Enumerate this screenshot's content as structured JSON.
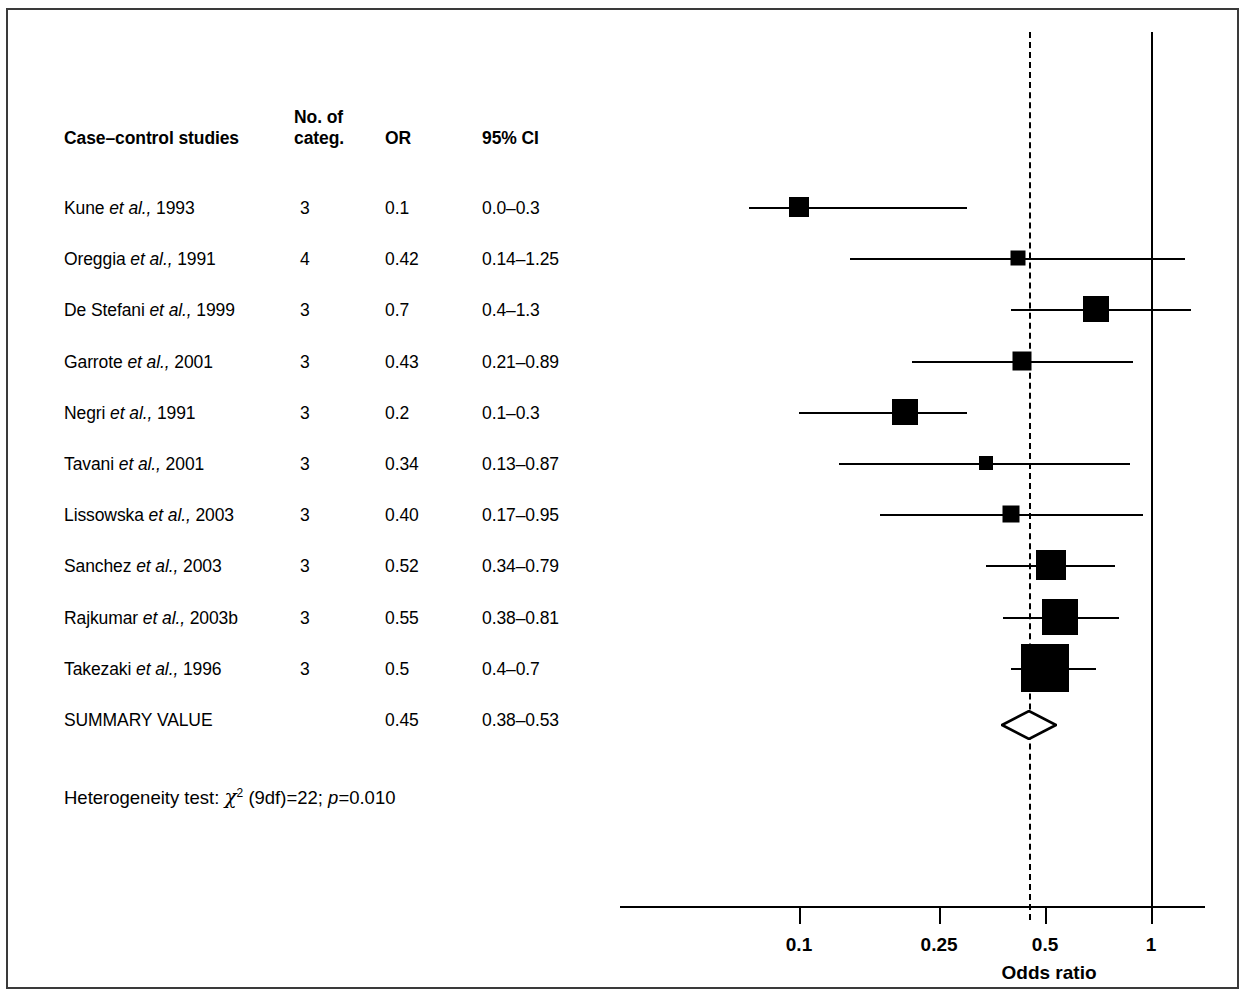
{
  "figure": {
    "caption_visible_fragment": "Figure 12. Case-control studies of",
    "axis_title": "Odds ratio"
  },
  "table": {
    "headers": {
      "study": "Case–control studies",
      "categ_line1": "No. of",
      "categ_line2": "categ.",
      "or": "OR",
      "ci": "95% CI"
    },
    "rows": [
      {
        "author": "Kune",
        "etal": "et al.,",
        "year": "1993",
        "label": "Kune et al., 1993",
        "categ": "3",
        "or": "0.1",
        "ci": "0.0–0.3"
      },
      {
        "author": "Oreggia",
        "etal": "et al.,",
        "year": "1991",
        "label": "Oreggia et al., 1991",
        "categ": "4",
        "or": "0.42",
        "ci": "0.14–1.25"
      },
      {
        "author": "De Stefani",
        "etal": "et al.,",
        "year": "1999",
        "label": "De Stefani et al., 1999",
        "categ": "3",
        "or": "0.7",
        "ci": "0.4–1.3"
      },
      {
        "author": "Garrote",
        "etal": "et al.,",
        "year": "2001",
        "label": "Garrote et al., 2001",
        "categ": "3",
        "or": "0.43",
        "ci": "0.21–0.89"
      },
      {
        "author": "Negri",
        "etal": "et al.,",
        "year": "1991",
        "label": "Negri et al., 1991",
        "categ": "3",
        "or": "0.2",
        "ci": "0.1–0.3"
      },
      {
        "author": "Tavani",
        "etal": "et al.,",
        "year": "2001",
        "label": "Tavani et al., 2001",
        "categ": "3",
        "or": "0.34",
        "ci": "0.13–0.87"
      },
      {
        "author": "Lissowska",
        "etal": "et al.,",
        "year": "2003",
        "label": "Lissowska et al., 2003",
        "categ": "3",
        "or": "0.40",
        "ci": "0.17–0.95"
      },
      {
        "author": "Sanchez",
        "etal": "et al.,",
        "year": "2003",
        "label": "Sanchez et al., 2003",
        "categ": "3",
        "or": "0.52",
        "ci": "0.34–0.79"
      },
      {
        "author": "Rajkumar",
        "etal": "et al.,",
        "year": "2003b",
        "label": "Rajkumar et al., 2003b",
        "categ": "3",
        "or": "0.55",
        "ci": "0.38–0.81"
      },
      {
        "author": "Takezaki",
        "etal": "et al.,",
        "year": "1996",
        "label": "Takezaki et al., 1996",
        "categ": "3",
        "or": "0.5",
        "ci": "0.4–0.7"
      },
      {
        "author": "SUMMARY VALUE",
        "etal": "",
        "year": "",
        "label": "SUMMARY VALUE",
        "categ": "",
        "or": "0.45",
        "ci": "0.38–0.53"
      }
    ]
  },
  "heterogeneity": {
    "prefix": "Heterogeneity test:",
    "chi_symbol": "χ",
    "chi_exponent": "2",
    "df": "(9df)=22;",
    "p_label": "p",
    "p_value": "=0.010",
    "full_text": "Heterogeneity test: χ2 (9df)=22; p=0.010"
  },
  "chart_data": {
    "type": "scatter",
    "subtype": "forest-plot",
    "title": "",
    "xlabel": "Odds ratio",
    "ylabel": "",
    "xscale": "log",
    "xlim": [
      0.07,
      1.35
    ],
    "xticks": [
      0.1,
      0.25,
      0.5,
      1
    ],
    "xtick_labels": [
      "0.1",
      "0.25",
      "0.5",
      "1"
    ],
    "grid": false,
    "legend": null,
    "reference_lines": [
      {
        "value": 1,
        "style": "solid",
        "label": "null effect"
      },
      {
        "value": 0.45,
        "style": "dashed",
        "label": "summary value"
      }
    ],
    "points": [
      {
        "study": "Kune et al., 1993",
        "categories": 3,
        "or": 0.1,
        "ci_low": 0.0,
        "ci_high": 0.3,
        "marker": "square",
        "marker_size": 20
      },
      {
        "study": "Oreggia et al., 1991",
        "categories": 4,
        "or": 0.42,
        "ci_low": 0.14,
        "ci_high": 1.25,
        "marker": "square",
        "marker_size": 15
      },
      {
        "study": "De Stefani et al., 1999",
        "categories": 3,
        "or": 0.7,
        "ci_low": 0.4,
        "ci_high": 1.3,
        "marker": "square",
        "marker_size": 26
      },
      {
        "study": "Garrote et al., 2001",
        "categories": 3,
        "or": 0.43,
        "ci_low": 0.21,
        "ci_high": 0.89,
        "marker": "square",
        "marker_size": 19
      },
      {
        "study": "Negri et al., 1991",
        "categories": 3,
        "or": 0.2,
        "ci_low": 0.1,
        "ci_high": 0.3,
        "marker": "square",
        "marker_size": 26
      },
      {
        "study": "Tavani et al., 2001",
        "categories": 3,
        "or": 0.34,
        "ci_low": 0.13,
        "ci_high": 0.87,
        "marker": "square",
        "marker_size": 14
      },
      {
        "study": "Lissowska et al., 2003",
        "categories": 3,
        "or": 0.4,
        "ci_low": 0.17,
        "ci_high": 0.95,
        "marker": "square",
        "marker_size": 17
      },
      {
        "study": "Sanchez et al., 2003",
        "categories": 3,
        "or": 0.52,
        "ci_low": 0.34,
        "ci_high": 0.79,
        "marker": "square",
        "marker_size": 30
      },
      {
        "study": "Rajkumar et al., 2003b",
        "categories": 3,
        "or": 0.55,
        "ci_low": 0.38,
        "ci_high": 0.81,
        "marker": "square",
        "marker_size": 36
      },
      {
        "study": "Takezaki et al., 1996",
        "categories": 3,
        "or": 0.5,
        "ci_low": 0.4,
        "ci_high": 0.7,
        "marker": "square",
        "marker_size": 48
      },
      {
        "study": "SUMMARY VALUE",
        "categories": null,
        "or": 0.45,
        "ci_low": 0.38,
        "ci_high": 0.53,
        "marker": "diamond-open",
        "marker_size": 28
      }
    ],
    "heterogeneity_test": {
      "chi2": 22,
      "df": 9,
      "p": 0.01
    },
    "colors": {
      "marker": "#000000",
      "line": "#000000",
      "frame": "#3a3a3a",
      "background": "#ffffff"
    }
  }
}
